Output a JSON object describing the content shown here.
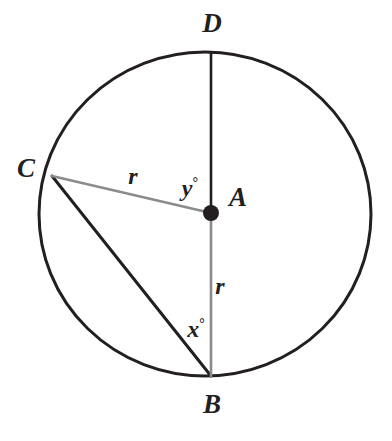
{
  "figure": {
    "background_color": "#ffffff"
  },
  "circle": {
    "center_label": "A",
    "center_x": 205,
    "center_y": 214,
    "radius_x": 166,
    "radius_y": 162,
    "stroke_color": "#231f20",
    "stroke_width": 3
  },
  "points": {
    "D": {
      "label": "D",
      "x": 211,
      "y": 53,
      "label_x": 212,
      "label_y": 23
    },
    "B": {
      "label": "B",
      "x": 211,
      "y": 376,
      "label_x": 212,
      "label_y": 404
    },
    "C": {
      "label": "C",
      "x": 52,
      "y": 176,
      "label_x": 26,
      "label_y": 168
    },
    "A": {
      "label": "A",
      "x": 211,
      "y": 213,
      "label_x": 238,
      "label_y": 197,
      "dot_radius": 8,
      "dot_color": "#231f20"
    }
  },
  "segments": [
    {
      "name": "segment-DA",
      "from": "D",
      "to": "A",
      "x1": 211,
      "y1": 53,
      "x2": 211,
      "y2": 213,
      "color": "#231f20",
      "width": 2.6
    },
    {
      "name": "segment-AB",
      "from": "A",
      "to": "B",
      "x1": 211,
      "y1": 213,
      "x2": 211,
      "y2": 376,
      "color": "#8b8b8b",
      "width": 2.6
    },
    {
      "name": "segment-CA",
      "from": "C",
      "to": "A",
      "x1": 52,
      "y1": 176,
      "x2": 211,
      "y2": 213,
      "color": "#8b8b8b",
      "width": 2.4
    },
    {
      "name": "segment-CB",
      "from": "C",
      "to": "B",
      "x1": 52,
      "y1": 176,
      "x2": 211,
      "y2": 376,
      "color": "#231f20",
      "width": 3
    }
  ],
  "labels": {
    "radius_ca": {
      "text": "r",
      "x": 133,
      "y": 176
    },
    "radius_ab": {
      "text": "r",
      "x": 220,
      "y": 286
    },
    "angle_y": {
      "symbol": "y",
      "degree": "°",
      "x": 190,
      "y": 188
    },
    "angle_x": {
      "symbol": "x",
      "degree": "°",
      "x": 196,
      "y": 329
    }
  }
}
